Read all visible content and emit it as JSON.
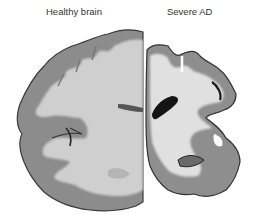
{
  "figure": {
    "labels": {
      "healthy": "Healthy brain",
      "ad": "Severe AD"
    },
    "colors": {
      "background": "#ffffff",
      "grey_matter": "#8c8c8c",
      "white_matter": "#cfcfcf",
      "outline": "#3a3a3a",
      "ventricle": "#1a1a1a",
      "label_text": "#333333"
    }
  }
}
